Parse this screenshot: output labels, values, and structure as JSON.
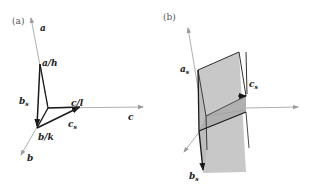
{
  "panel_a": {
    "label": "(a)",
    "axes": {
      "a": "a",
      "b": "b",
      "c": "c"
    },
    "vectors": {
      "a_over_h": "a/h",
      "b_over_k": "b/k",
      "c_over_l": "c/l",
      "b_s_main": "b",
      "b_s_sub": "s",
      "c_s_main": "c",
      "c_s_sub": "s"
    }
  },
  "panel_b": {
    "label": "(b)",
    "vectors": {
      "a_s_main": "a",
      "a_s_sub": "s",
      "b_s_main": "b",
      "b_s_sub": "s",
      "c_s_main": "c",
      "c_s_sub": "s"
    }
  },
  "colors": {
    "axis": "#9a9a9a",
    "vector": "#1a1a1a",
    "plane_fill": "#c8c8c8",
    "plane_fill_dark": "#b4b4b4"
  }
}
